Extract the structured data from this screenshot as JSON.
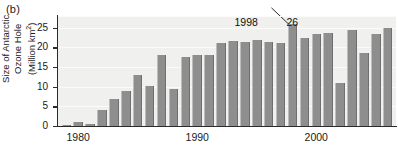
{
  "panel": {
    "label": "(b)"
  },
  "chart_data": {
    "type": "bar",
    "title": "",
    "xlabel": "",
    "ylabel": "Size of Antarctic Ozone Hole (Million km²)",
    "ylabel_lines": [
      "Size of Antarctic",
      "Ozone Hole",
      "(Million km",
      ")"
    ],
    "ylabel_unit_sup": "2",
    "ylim": [
      0,
      28
    ],
    "yticks": [
      0,
      5,
      10,
      15,
      20,
      25
    ],
    "ytick_labels": [
      "0",
      "5",
      "10",
      "15",
      "20",
      "25"
    ],
    "xlim": [
      1978.3,
      2006.7
    ],
    "xticks": [
      1980,
      1990,
      2000
    ],
    "xtick_labels": [
      "1980",
      "1990",
      "2000"
    ],
    "grid": true,
    "legend": "none",
    "bar_color": "#8e8e8e",
    "plot_background": "#f0f0ee",
    "categories": [
      1979,
      1980,
      1981,
      1982,
      1983,
      1984,
      1985,
      1986,
      1987,
      1988,
      1989,
      1990,
      1991,
      1992,
      1993,
      1994,
      1995,
      1996,
      1997,
      1998,
      1999,
      2000,
      2001,
      2002,
      2003,
      2004,
      2005,
      2006
    ],
    "values": [
      0.2,
      1.1,
      0.6,
      4.1,
      7.0,
      9.0,
      13.1,
      10.3,
      18.0,
      9.4,
      17.6,
      18.2,
      18.1,
      21.2,
      21.7,
      21.5,
      21.9,
      21.5,
      21.2,
      26.0,
      22.5,
      23.5,
      23.6,
      11.0,
      24.5,
      18.7,
      23.4,
      25.0
    ],
    "annotations": [
      {
        "text": "1998",
        "points_to_year": 1998,
        "points_to_value": 26.0
      },
      {
        "text": "26",
        "points_to_year": 1998,
        "points_to_value": 26.0
      }
    ]
  }
}
